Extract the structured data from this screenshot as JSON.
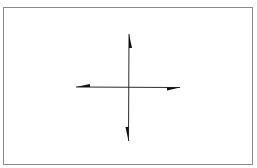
{
  "diagram": {
    "type": "axes-cross",
    "colors": {
      "line": "#2a2a2a",
      "arrowhead": "#111111",
      "frame": "#8a8a8a",
      "background": "#ffffff"
    },
    "center": {
      "x": 129,
      "y": 87
    },
    "vertical_axis": {
      "x": 129,
      "y_top": 34,
      "y_bottom": 141
    },
    "horizontal_axis": {
      "y": 87,
      "x_left": 76,
      "x_right": 180
    },
    "arrows": [
      {
        "direction": "up",
        "barb_side": "right"
      },
      {
        "direction": "down",
        "barb_side": "left"
      },
      {
        "direction": "left",
        "barb_side": "top"
      },
      {
        "direction": "right",
        "barb_side": "bottom"
      }
    ]
  }
}
